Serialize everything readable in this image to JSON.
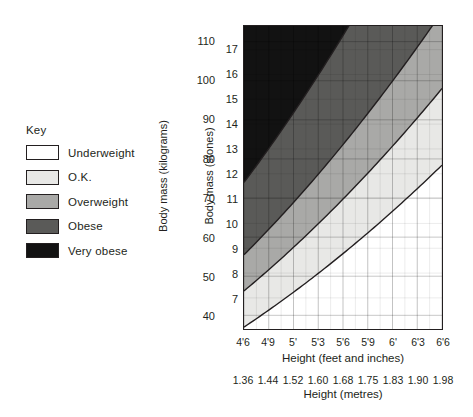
{
  "legend": {
    "title": "Key",
    "items": [
      {
        "label": "Underweight",
        "color": "#ffffff"
      },
      {
        "label": "O.K.",
        "color": "#e8e8e6"
      },
      {
        "label": "Overweight",
        "color": "#a9a9a7"
      },
      {
        "label": "Obese",
        "color": "#5a5a58"
      },
      {
        "label": "Very obese",
        "color": "#121212"
      }
    ]
  },
  "chart_data": {
    "type": "area",
    "title": "",
    "xlabel": "Height (feet and inches)",
    "xlabel_secondary": "Height (metres)",
    "ylabel": "Body mass (kilograms)",
    "ylabel_secondary": "Body mass (stones)",
    "grid": true,
    "legend_position": "left",
    "x": {
      "label": "Height (feet and inches)",
      "ticks": [
        "4'6",
        "4'9",
        "5'",
        "5'3",
        "5'6",
        "5'9",
        "6'",
        "6'3",
        "6'6"
      ],
      "metres_label": "Height (metres)",
      "metres_ticks": [
        "1.36",
        "1.44",
        "1.52",
        "1.60",
        "1.68",
        "1.75",
        "1.83",
        "1.90",
        "1.98"
      ],
      "range_metres": [
        1.36,
        1.98
      ]
    },
    "y_kilograms": {
      "label": "Body mass (kilograms)",
      "ticks": [
        110,
        100,
        90,
        80,
        70,
        60,
        50,
        40
      ],
      "range": [
        36.5,
        114.0
      ]
    },
    "y_stones": {
      "label": "Body mass (stones)",
      "ticks": [
        17,
        16,
        15,
        14,
        13,
        12,
        11,
        10,
        9,
        8,
        7
      ],
      "range": [
        6.55,
        17.45
      ]
    },
    "bands": [
      {
        "name": "Very obese",
        "color": "#121212",
        "bmi_min": 40.0,
        "bmi_max": null
      },
      {
        "name": "Obese",
        "color": "#5a5a58",
        "bmi_min": 30.0,
        "bmi_max": 40.0
      },
      {
        "name": "Overweight",
        "color": "#a9a9a7",
        "bmi_min": 25.0,
        "bmi_max": 30.0
      },
      {
        "name": "O.K.",
        "color": "#e8e8e6",
        "bmi_min": 20.0,
        "bmi_max": 25.0
      },
      {
        "name": "Underweight",
        "color": "#ffffff",
        "bmi_min": null,
        "bmi_max": 20.0
      }
    ],
    "boundaries_bmi": [
      20,
      25,
      30,
      40
    ]
  }
}
